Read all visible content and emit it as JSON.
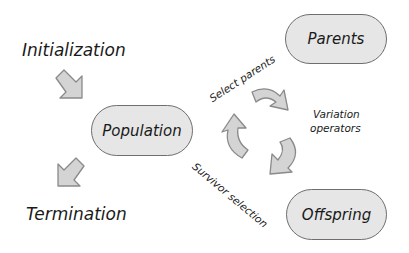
{
  "diagram": {
    "nodes": {
      "initialization": "Initialization",
      "population": "Population",
      "parents": "Parents",
      "offspring": "Offspring",
      "termination": "Termination"
    },
    "edges": {
      "select_parents": "Select parents",
      "variation_operators_line1": "Variation",
      "variation_operators_line2": "operators",
      "survivor_selection": "Survivor selection"
    },
    "colors": {
      "node_fill": "#e6e6e6",
      "node_border": "#6e6e6e",
      "arrow_fill": "#d4d4d4",
      "arrow_stroke": "#8a8a8a"
    }
  }
}
